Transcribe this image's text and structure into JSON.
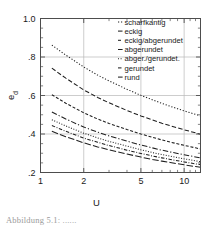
{
  "chart_data": {
    "type": "line",
    "title": "",
    "subtitle": "",
    "xlabel": "U",
    "ylabel": "e_d",
    "ylabel_base": "e",
    "ylabel_sub": "d",
    "xscale": "log",
    "yscale": "linear",
    "xlim": [
      1,
      13
    ],
    "ylim": [
      0.2,
      1.0
    ],
    "grid": true,
    "grid_axes": "both",
    "xticks": [
      1,
      2,
      5,
      10
    ],
    "xticklabels": [
      "1",
      "2",
      "5",
      "10"
    ],
    "xminorticks": [
      3,
      4,
      6,
      7,
      8,
      9,
      11,
      12,
      13
    ],
    "yticks": [
      0.2,
      0.4,
      0.6,
      0.8,
      1.0
    ],
    "yticklabels": [
      ".2",
      ".4",
      ".6",
      ".8",
      "1.0"
    ],
    "yminorticks": [
      0.25,
      0.3,
      0.35,
      0.45,
      0.5,
      0.55,
      0.65,
      0.7,
      0.75,
      0.85,
      0.9,
      0.95
    ],
    "legend_position": "top-right",
    "series": [
      {
        "name": "scharfkantig",
        "dash": "1.2 1.8",
        "x": [
          1.2,
          1.5,
          2.0,
          2.5,
          3.0,
          4.0,
          5.0,
          6.0,
          7.0,
          8.0,
          10.0,
          12.0,
          13.0
        ],
        "values": [
          0.862,
          0.81,
          0.748,
          0.706,
          0.676,
          0.632,
          0.601,
          0.578,
          0.559,
          0.544,
          0.52,
          0.502,
          0.494
        ]
      },
      {
        "name": "eckig",
        "dash": "4.5 2.2",
        "x": [
          1.2,
          1.5,
          2.0,
          2.5,
          3.0,
          4.0,
          5.0,
          6.0,
          7.0,
          8.0,
          10.0,
          12.0,
          13.0
        ],
        "values": [
          0.742,
          0.69,
          0.629,
          0.59,
          0.562,
          0.522,
          0.494,
          0.473,
          0.456,
          0.443,
          0.422,
          0.406,
          0.399
        ]
      },
      {
        "name": "eckig/abgerundet",
        "dash": "3.0 1.8",
        "x": [
          1.2,
          1.5,
          2.0,
          2.5,
          3.0,
          4.0,
          5.0,
          6.0,
          7.0,
          8.0,
          10.0,
          12.0,
          13.0
        ],
        "values": [
          0.604,
          0.56,
          0.51,
          0.478,
          0.455,
          0.423,
          0.4,
          0.383,
          0.369,
          0.358,
          0.341,
          0.328,
          0.322
        ]
      },
      {
        "name": "abgerundet",
        "dash": "5.5 2.0 1.2 2.0",
        "x": [
          1.2,
          1.5,
          2.0,
          2.5,
          3.0,
          4.0,
          5.0,
          6.0,
          7.0,
          8.0,
          10.0,
          12.0,
          13.0
        ],
        "values": [
          0.514,
          0.478,
          0.436,
          0.41,
          0.39,
          0.363,
          0.343,
          0.328,
          0.316,
          0.307,
          0.292,
          0.281,
          0.276
        ]
      },
      {
        "name": "abger./gerundet.",
        "dash": "1.0 1.6",
        "x": [
          1.2,
          1.5,
          2.0,
          2.5,
          3.0,
          4.0,
          5.0,
          6.0,
          7.0,
          8.0,
          10.0,
          12.0,
          13.0
        ],
        "values": [
          0.474,
          0.442,
          0.404,
          0.38,
          0.362,
          0.337,
          0.318,
          0.304,
          0.293,
          0.285,
          0.271,
          0.261,
          0.256
        ]
      },
      {
        "name": "gerundet",
        "dash": "3.5 1.6 0.9 1.6",
        "x": [
          1.2,
          1.5,
          2.0,
          2.5,
          3.0,
          4.0,
          5.0,
          6.0,
          7.0,
          8.0,
          10.0,
          12.0,
          13.0
        ],
        "values": [
          0.444,
          0.414,
          0.379,
          0.357,
          0.34,
          0.316,
          0.299,
          0.286,
          0.276,
          0.268,
          0.255,
          0.245,
          0.241
        ]
      },
      {
        "name": "rund",
        "dash": "6.5 2.2",
        "x": [
          1.2,
          1.5,
          2.0,
          2.5,
          3.0,
          4.0,
          5.0,
          6.0,
          7.0,
          8.0,
          10.0,
          12.0,
          13.0
        ],
        "values": [
          0.414,
          0.386,
          0.354,
          0.333,
          0.318,
          0.296,
          0.28,
          0.268,
          0.259,
          0.252,
          0.24,
          0.231,
          0.227
        ]
      }
    ],
    "legend_entries": [
      "scharfkantig",
      "eckig",
      "eckig/abgerundet",
      "abgerundet",
      "abger./gerundet.",
      "gerundet",
      "rund"
    ],
    "colors": {
      "curve": "#1f1f1f",
      "frame": "#4d4d4d",
      "grid": "#b8b8b8",
      "text": "#1a1a1a"
    }
  },
  "caption": {
    "text": "Abbildung 5.1: ......"
  }
}
